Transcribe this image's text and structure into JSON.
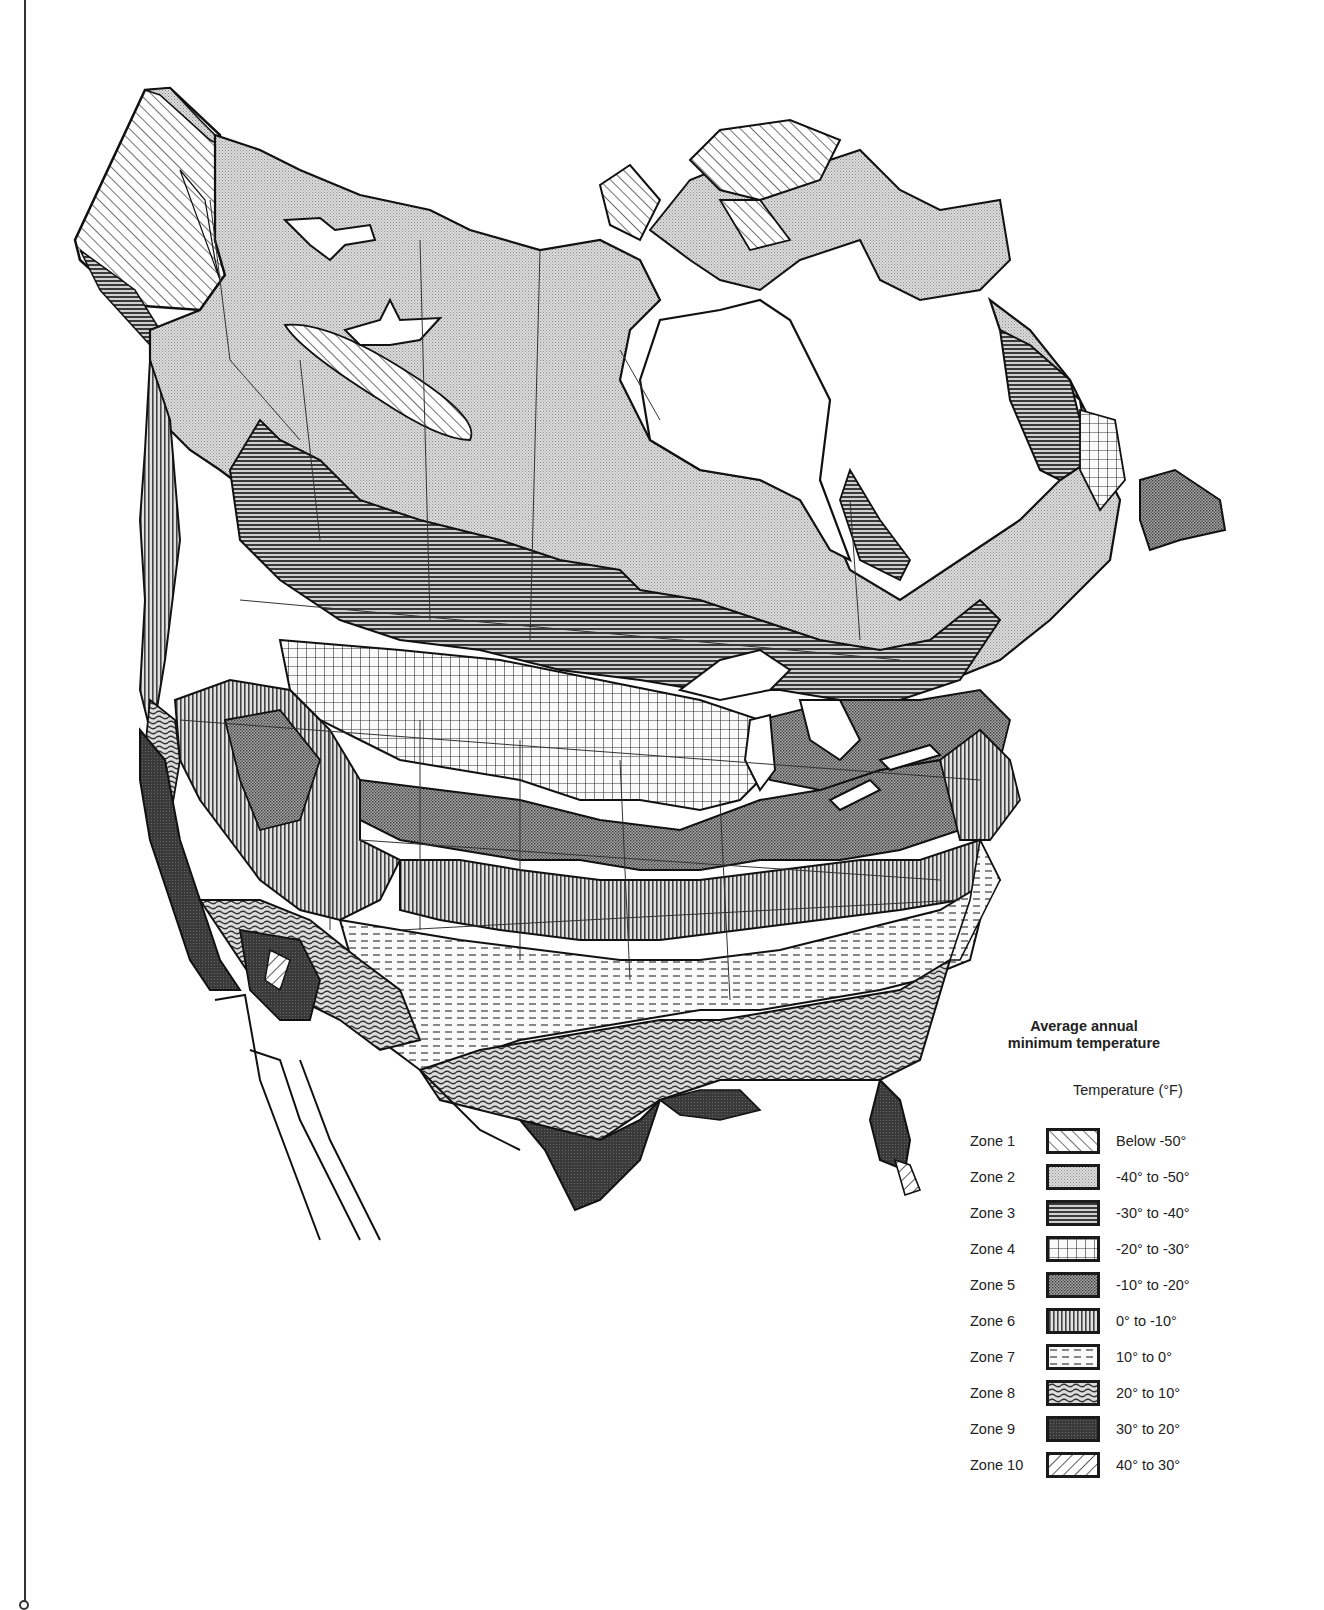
{
  "map": {
    "title": "Average annual minimum temperature",
    "title_lines": [
      "Average annual",
      "minimum temperature"
    ],
    "region": "North America (Canada, United States, northern Mexico)",
    "unit_label": "Temperature  (°F)"
  },
  "legend": {
    "zones": [
      {
        "zone": "Zone 1",
        "range": "Below -50°",
        "pattern": "diagonal-hatch-forward",
        "fill": "#ffffff"
      },
      {
        "zone": "Zone 2",
        "range": "-40° to -50°",
        "pattern": "fine-stipple-light",
        "fill": "#d6d6d6"
      },
      {
        "zone": "Zone 3",
        "range": "-30° to -40°",
        "pattern": "horizontal-lines",
        "fill": "#8a8a8a"
      },
      {
        "zone": "Zone 4",
        "range": "-20° to -30°",
        "pattern": "grid-crosshatch",
        "fill": "#f2f2f2"
      },
      {
        "zone": "Zone 5",
        "range": "-10° to -20°",
        "pattern": "dense-stipple-medium",
        "fill": "#8f8f8f"
      },
      {
        "zone": "Zone 6",
        "range": "0° to -10°",
        "pattern": "vertical-lines",
        "fill": "#b5b5b5"
      },
      {
        "zone": "Zone 7",
        "range": "10° to 0°",
        "pattern": "dashed-horizontal",
        "fill": "#f4f4f4"
      },
      {
        "zone": "Zone 8",
        "range": "20° to 10°",
        "pattern": "wavy-lines",
        "fill": "#9a9a9a"
      },
      {
        "zone": "Zone 9",
        "range": "30° to 20°",
        "pattern": "dark-stipple",
        "fill": "#3e3e3e"
      },
      {
        "zone": "Zone 10",
        "range": "40° to 30°",
        "pattern": "diagonal-hatch-back",
        "fill": "#ffffff"
      }
    ]
  }
}
